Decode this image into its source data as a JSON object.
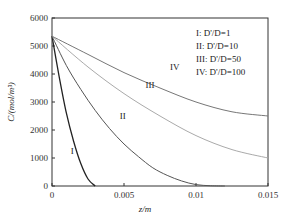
{
  "chart_data": {
    "type": "line",
    "title": "",
    "xlabel": "z/m",
    "ylabel": "C/(mol/m³)",
    "xlim": [
      0,
      0.015
    ],
    "ylim": [
      0,
      6000
    ],
    "x_ticks": [
      "0",
      "0.005",
      "0.01",
      "0.015"
    ],
    "y_ticks": [
      "0",
      "1000",
      "2000",
      "3000",
      "4000",
      "5000",
      "6000"
    ],
    "grid": false,
    "legend_position": "upper right (inside)",
    "legend": [
      {
        "id": "I",
        "text": "I: D'/D=1"
      },
      {
        "id": "II",
        "text": "II: D'/D=10"
      },
      {
        "id": "III",
        "text": "III: D'/D=50"
      },
      {
        "id": "IV",
        "text": "IV: D'/D=100"
      }
    ],
    "series": [
      {
        "name": "I",
        "ratio": 1,
        "color": "#222222",
        "x": [
          0,
          0.0005,
          0.001,
          0.0015,
          0.002,
          0.0025,
          0.003
        ],
        "y": [
          5350,
          3900,
          2600,
          1600,
          800,
          250,
          0
        ]
      },
      {
        "name": "II",
        "ratio": 10,
        "color": "#555555",
        "x": [
          0,
          0.001,
          0.002,
          0.003,
          0.004,
          0.005,
          0.006,
          0.007,
          0.008,
          0.009,
          0.01,
          0.011,
          0.012
        ],
        "y": [
          5350,
          4300,
          3450,
          2700,
          2050,
          1500,
          1050,
          650,
          380,
          180,
          50,
          10,
          0
        ]
      },
      {
        "name": "III",
        "ratio": 50,
        "color": "#aaaaaa",
        "x": [
          0,
          0.0025,
          0.005,
          0.0075,
          0.01,
          0.0125,
          0.015
        ],
        "y": [
          5350,
          4250,
          3300,
          2500,
          1800,
          1300,
          1000
        ]
      },
      {
        "name": "IV",
        "ratio": 100,
        "color": "#777777",
        "x": [
          0,
          0.0025,
          0.005,
          0.0075,
          0.01,
          0.0125,
          0.015
        ],
        "y": [
          5350,
          4700,
          4050,
          3500,
          3000,
          2650,
          2500
        ]
      }
    ],
    "curve_labels": [
      {
        "text": "I",
        "x": 0.0013,
        "y": 1150
      },
      {
        "text": "II",
        "x": 0.0047,
        "y": 2400
      },
      {
        "text": "III",
        "x": 0.0065,
        "y": 3500
      },
      {
        "text": "IV",
        "x": 0.0082,
        "y": 4150
      }
    ]
  }
}
